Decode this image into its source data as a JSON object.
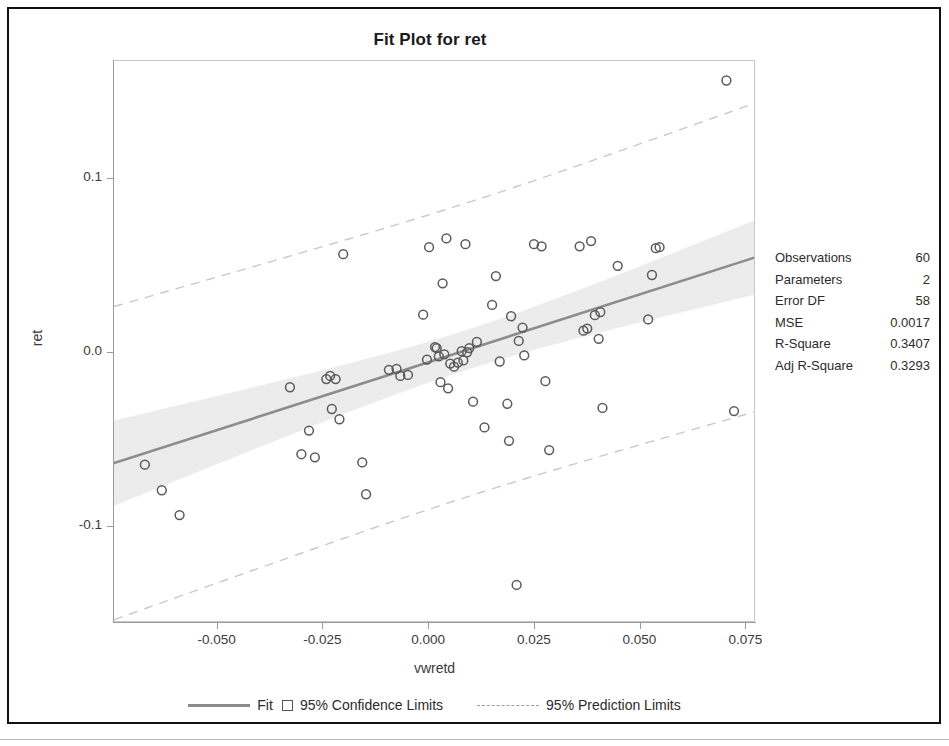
{
  "plot": {
    "title": "Fit Plot for ret",
    "xlabel": "vwretd",
    "ylabel": "ret"
  },
  "axes": {
    "x_ticks": [
      "-0.050",
      "-0.025",
      "0.000",
      "0.025",
      "0.050",
      "0.075"
    ],
    "y_ticks": [
      "0.1",
      "0.0",
      "-0.1"
    ]
  },
  "stats": {
    "title": "Fit Statistics",
    "rows": [
      {
        "label": "Observations",
        "value": "60"
      },
      {
        "label": "Parameters",
        "value": "2"
      },
      {
        "label": "Error DF",
        "value": "58"
      },
      {
        "label": "MSE",
        "value": "0.0017"
      },
      {
        "label": "R-Square",
        "value": "0.3407"
      },
      {
        "label": "Adj R-Square",
        "value": "0.3293"
      }
    ]
  },
  "legend": {
    "fit": "Fit",
    "confidence": "95% Confidence Limits",
    "prediction": "95% Prediction Limits"
  },
  "colors": {
    "fit_line": "#8c8c8c",
    "ci_band": "#ececec",
    "pred_line": "#c9c9c9",
    "marker_stroke": "#5a5a5a",
    "frame": "#c9c9c9",
    "axis": "#9a9a9a",
    "text": "#2b2b2b",
    "window_border": "#111111"
  },
  "chart_data": {
    "type": "scatter",
    "title": "Fit Plot for ret",
    "xlabel": "vwretd",
    "ylabel": "ret",
    "xlim": [
      -0.0745,
      0.0773
    ],
    "ylim": [
      -0.155,
      0.168
    ],
    "x_ticks": [
      -0.05,
      -0.025,
      0.0,
      0.025,
      0.05,
      0.075
    ],
    "y_ticks": [
      -0.1,
      0.0,
      0.1
    ],
    "grid": false,
    "legend_position": "bottom",
    "n_observations": 60,
    "fit": {
      "label": "Fit",
      "type": "linear_regression",
      "intercept": -0.005,
      "slope": 0.78,
      "r_square": 0.3407,
      "adj_r_square": 0.3293,
      "mse": 0.0017,
      "parameters": 2,
      "error_df": 58
    },
    "confidence_band": {
      "label": "95% Confidence Limits",
      "level": 0.95,
      "half_width_at_center": 0.0115,
      "half_width_at_edges": 0.0245
    },
    "prediction_band": {
      "label": "95% Prediction Limits",
      "level": 0.95,
      "half_width_at_center": 0.0845,
      "half_width_at_edges": 0.09
    },
    "points": [
      {
        "x": -0.0672,
        "y": -0.064
      },
      {
        "x": -0.0632,
        "y": -0.0787
      },
      {
        "x": -0.059,
        "y": -0.093
      },
      {
        "x": -0.0329,
        "y": -0.0195
      },
      {
        "x": -0.0302,
        "y": -0.058
      },
      {
        "x": -0.0284,
        "y": -0.0444
      },
      {
        "x": -0.027,
        "y": -0.0598
      },
      {
        "x": -0.0243,
        "y": -0.0148
      },
      {
        "x": -0.0234,
        "y": -0.013
      },
      {
        "x": -0.023,
        "y": -0.032
      },
      {
        "x": -0.0221,
        "y": -0.0148
      },
      {
        "x": -0.0212,
        "y": -0.0379
      },
      {
        "x": -0.0203,
        "y": 0.057
      },
      {
        "x": -0.0158,
        "y": -0.0627
      },
      {
        "x": -0.0149,
        "y": -0.081
      },
      {
        "x": -0.0095,
        "y": -0.0095
      },
      {
        "x": -0.0077,
        "y": -0.0089
      },
      {
        "x": -0.0068,
        "y": -0.013
      },
      {
        "x": -0.005,
        "y": -0.0124
      },
      {
        "x": -0.0014,
        "y": 0.0222
      },
      {
        "x": -0.0005,
        "y": -0.0036
      },
      {
        "x": 0.0,
        "y": 0.061
      },
      {
        "x": 0.0014,
        "y": 0.0036
      },
      {
        "x": 0.0018,
        "y": 0.003
      },
      {
        "x": 0.0023,
        "y": -0.0018
      },
      {
        "x": 0.0027,
        "y": -0.0166
      },
      {
        "x": 0.0032,
        "y": 0.0402
      },
      {
        "x": 0.0036,
        "y": -0.0006
      },
      {
        "x": 0.0041,
        "y": 0.066
      },
      {
        "x": 0.0045,
        "y": -0.0201
      },
      {
        "x": 0.005,
        "y": -0.0059
      },
      {
        "x": 0.0059,
        "y": -0.0077
      },
      {
        "x": 0.0068,
        "y": -0.0053
      },
      {
        "x": 0.0077,
        "y": 0.0012
      },
      {
        "x": 0.0081,
        "y": -0.0041
      },
      {
        "x": 0.0086,
        "y": 0.0627
      },
      {
        "x": 0.009,
        "y": 0.0006
      },
      {
        "x": 0.0095,
        "y": 0.003
      },
      {
        "x": 0.0104,
        "y": -0.0278
      },
      {
        "x": 0.0113,
        "y": 0.0065
      },
      {
        "x": 0.0131,
        "y": -0.0426
      },
      {
        "x": 0.0149,
        "y": 0.0278
      },
      {
        "x": 0.0158,
        "y": 0.0444
      },
      {
        "x": 0.0167,
        "y": -0.0047
      },
      {
        "x": 0.0185,
        "y": -0.029
      },
      {
        "x": 0.0189,
        "y": -0.0503
      },
      {
        "x": 0.0194,
        "y": 0.0213
      },
      {
        "x": 0.0207,
        "y": -0.1331
      },
      {
        "x": 0.0212,
        "y": 0.0071
      },
      {
        "x": 0.0221,
        "y": 0.0148
      },
      {
        "x": 0.0225,
        "y": -0.0012
      },
      {
        "x": 0.0248,
        "y": 0.0627
      },
      {
        "x": 0.0266,
        "y": 0.0615
      },
      {
        "x": 0.0275,
        "y": -0.016
      },
      {
        "x": 0.0284,
        "y": -0.0556
      },
      {
        "x": 0.0356,
        "y": 0.0615
      },
      {
        "x": 0.0365,
        "y": 0.013
      },
      {
        "x": 0.0374,
        "y": 0.0142
      },
      {
        "x": 0.0383,
        "y": 0.0645
      },
      {
        "x": 0.0392,
        "y": 0.0219
      },
      {
        "x": 0.0401,
        "y": 0.0083
      },
      {
        "x": 0.0405,
        "y": 0.0237
      },
      {
        "x": 0.041,
        "y": -0.0314
      },
      {
        "x": 0.0446,
        "y": 0.0503
      },
      {
        "x": 0.0518,
        "y": 0.0195
      },
      {
        "x": 0.0527,
        "y": 0.045
      },
      {
        "x": 0.0536,
        "y": 0.0604
      },
      {
        "x": 0.0545,
        "y": 0.061
      },
      {
        "x": 0.0703,
        "y": 0.1568
      },
      {
        "x": 0.0721,
        "y": -0.0332
      }
    ]
  }
}
